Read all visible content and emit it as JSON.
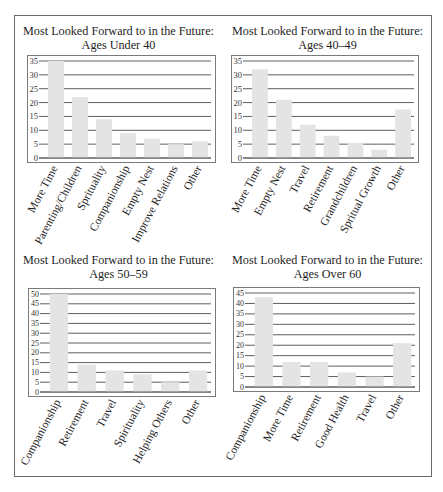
{
  "chart_data": [
    {
      "type": "bar",
      "title": "Most Looked Forward to in the Future: Ages Under 40",
      "title_lines": [
        "Most Looked Forward to in the Future:",
        "Ages Under 40"
      ],
      "categories": [
        "More Time",
        "Parenting/Children",
        "Sprituality",
        "Companionship",
        "Empty Nest",
        "Improve Relations",
        "Other"
      ],
      "values": [
        35,
        22,
        14,
        9,
        7,
        5,
        6
      ],
      "xlabel": "",
      "ylabel": "",
      "ylim": [
        0,
        35
      ],
      "yticks": [
        0,
        5,
        10,
        15,
        20,
        25,
        30,
        35
      ],
      "grid": true,
      "legend": null
    },
    {
      "type": "bar",
      "title": "Most Looked Forward to in the Future: Ages 40–49",
      "title_lines": [
        "Most Looked Forward to in the Future:",
        "Ages 40–49"
      ],
      "categories": [
        "More Time",
        "Empty Nest",
        "Travel",
        "Retirement",
        "Grandchildren",
        "Spritual Growth",
        "Other"
      ],
      "values": [
        32,
        21,
        12,
        8,
        5.5,
        3,
        17.5
      ],
      "xlabel": "",
      "ylabel": "",
      "ylim": [
        0,
        35
      ],
      "yticks": [
        0,
        5,
        10,
        15,
        20,
        25,
        30,
        35
      ],
      "grid": true,
      "legend": null
    },
    {
      "type": "bar",
      "title": "Most Looked Forward to in the Future: Ages 50–59",
      "title_lines": [
        "Most Looked Forward to in the Future:",
        "Ages 50–59"
      ],
      "categories": [
        "Companionship",
        "Retirement",
        "Travel",
        "Spirituality",
        "Helping Others",
        "Other"
      ],
      "values": [
        50,
        14,
        11,
        9,
        5,
        11
      ],
      "xlabel": "",
      "ylabel": "",
      "ylim": [
        0,
        50
      ],
      "yticks": [
        0,
        5,
        10,
        15,
        20,
        25,
        30,
        35,
        40,
        45,
        50
      ],
      "grid": true,
      "legend": null
    },
    {
      "type": "bar",
      "title": "Most Looked Forward to in the Future: Ages Over 60",
      "title_lines": [
        "Most Looked Forward to in the Future:",
        "Ages Over 60"
      ],
      "categories": [
        "Companionship",
        "More Time",
        "Retirement",
        "Good Health",
        "Travel",
        "Other"
      ],
      "values": [
        43,
        12,
        12,
        7,
        5,
        21
      ],
      "xlabel": "",
      "ylabel": "",
      "ylim": [
        0,
        45
      ],
      "yticks": [
        0,
        5,
        10,
        15,
        20,
        25,
        30,
        35,
        40,
        45
      ],
      "grid": true,
      "legend": null
    }
  ],
  "colors": {
    "bar": "#e4e4e4",
    "grid": "#5e5e5e",
    "axis_text": "#333333"
  }
}
